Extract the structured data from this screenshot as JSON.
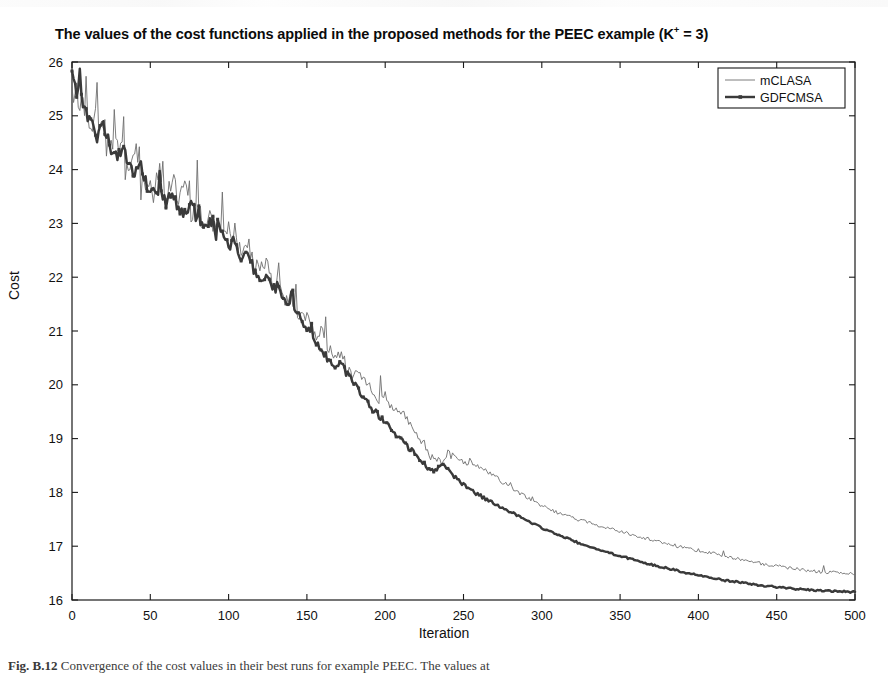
{
  "figure": {
    "title_prefix": "The values of the cost functions applied in the proposed methods for the PEEC example (K",
    "title_superscript": "+",
    "title_suffix": " = 3)",
    "caption_label": "Fig. B.12",
    "caption_text": "  Convergence of the cost values in their best runs for example PEEC. The values at"
  },
  "chart_data": {
    "type": "line",
    "title": "The values of the cost functions applied in the proposed methods for the PEEC example (K+ = 3)",
    "xlabel": "Iteration",
    "ylabel": "Cost",
    "xlim": [
      0,
      500
    ],
    "ylim": [
      16,
      26
    ],
    "xticks": [
      0,
      50,
      100,
      150,
      200,
      250,
      300,
      350,
      400,
      450,
      500
    ],
    "yticks": [
      16,
      17,
      18,
      19,
      20,
      21,
      22,
      23,
      24,
      25,
      26
    ],
    "grid": false,
    "legend_position": "top-right",
    "colors": {
      "mCLASA": "#6e6e6e",
      "GDFCMSA": "#3a3a3a",
      "axis": "#1a1a1a"
    },
    "series": [
      {
        "name": "mCLASA",
        "style": "thin-line",
        "x": [
          0,
          4,
          8,
          12,
          16,
          20,
          24,
          28,
          32,
          36,
          40,
          44,
          48,
          52,
          56,
          60,
          64,
          68,
          72,
          76,
          80,
          84,
          88,
          92,
          96,
          100,
          104,
          108,
          112,
          116,
          120,
          124,
          128,
          132,
          136,
          140,
          144,
          148,
          152,
          156,
          160,
          164,
          168,
          172,
          176,
          180,
          184,
          188,
          192,
          196,
          200,
          204,
          208,
          212,
          216,
          220,
          224,
          228,
          232,
          236,
          240,
          244,
          248,
          252,
          256,
          260,
          264,
          268,
          272,
          276,
          280,
          284,
          288,
          292,
          296,
          300,
          310,
          320,
          330,
          340,
          350,
          360,
          370,
          380,
          390,
          400,
          410,
          420,
          430,
          440,
          450,
          460,
          470,
          480,
          490,
          500
        ],
        "values": [
          25.55,
          25.35,
          25.05,
          24.72,
          24.95,
          24.6,
          24.32,
          24.55,
          24.18,
          23.9,
          24.25,
          23.62,
          23.85,
          23.48,
          24.05,
          23.35,
          23.95,
          23.3,
          23.72,
          23.18,
          23.4,
          22.95,
          23.25,
          22.8,
          23.1,
          22.62,
          22.85,
          22.4,
          22.7,
          22.25,
          22.1,
          22.35,
          21.8,
          21.95,
          21.55,
          21.7,
          21.25,
          21.4,
          21.05,
          20.85,
          21.0,
          20.65,
          20.45,
          20.58,
          20.3,
          20.15,
          20.25,
          20.05,
          19.9,
          19.7,
          19.82,
          19.55,
          19.4,
          19.48,
          19.25,
          19.1,
          18.95,
          18.7,
          18.62,
          18.55,
          18.72,
          18.65,
          18.58,
          18.5,
          18.55,
          18.45,
          18.4,
          18.32,
          18.25,
          18.18,
          18.1,
          18.02,
          17.95,
          17.88,
          17.8,
          17.75,
          17.62,
          17.52,
          17.44,
          17.36,
          17.28,
          17.2,
          17.12,
          17.05,
          16.98,
          16.92,
          16.86,
          16.8,
          16.74,
          16.68,
          16.63,
          16.59,
          16.55,
          16.52,
          16.5,
          16.48
        ]
      },
      {
        "name": "GDFCMSA",
        "style": "thick-line-with-markers",
        "x": [
          0,
          4,
          8,
          12,
          16,
          20,
          24,
          28,
          32,
          36,
          40,
          44,
          48,
          52,
          56,
          60,
          64,
          68,
          72,
          76,
          80,
          84,
          88,
          92,
          96,
          100,
          104,
          108,
          112,
          116,
          120,
          124,
          128,
          132,
          136,
          140,
          144,
          148,
          152,
          156,
          160,
          164,
          168,
          172,
          176,
          180,
          184,
          188,
          192,
          196,
          200,
          204,
          208,
          212,
          216,
          220,
          224,
          228,
          232,
          236,
          240,
          244,
          248,
          252,
          256,
          260,
          264,
          268,
          272,
          276,
          280,
          284,
          288,
          292,
          296,
          300,
          310,
          320,
          330,
          340,
          350,
          360,
          370,
          380,
          390,
          400,
          410,
          420,
          430,
          440,
          450,
          460,
          470,
          480,
          490,
          500
        ],
        "values": [
          25.7,
          25.42,
          25.15,
          24.85,
          24.62,
          24.78,
          24.45,
          24.28,
          24.4,
          24.1,
          23.88,
          24.05,
          23.7,
          23.52,
          23.65,
          23.38,
          23.55,
          23.3,
          23.18,
          23.42,
          23.05,
          22.9,
          23.1,
          22.78,
          22.95,
          22.55,
          22.7,
          22.3,
          22.45,
          22.15,
          21.95,
          22.08,
          21.75,
          21.85,
          21.5,
          21.6,
          21.3,
          21.15,
          20.95,
          20.78,
          20.6,
          20.45,
          20.3,
          20.38,
          20.18,
          20.05,
          19.88,
          19.7,
          19.55,
          19.42,
          19.3,
          19.18,
          19.05,
          18.92,
          18.8,
          18.68,
          18.55,
          18.42,
          18.4,
          18.5,
          18.45,
          18.3,
          18.2,
          18.1,
          18.02,
          17.95,
          17.88,
          17.82,
          17.76,
          17.7,
          17.64,
          17.58,
          17.52,
          17.46,
          17.4,
          17.34,
          17.22,
          17.1,
          16.99,
          16.9,
          16.82,
          16.74,
          16.66,
          16.59,
          16.52,
          16.46,
          16.4,
          16.35,
          16.31,
          16.27,
          16.24,
          16.21,
          16.19,
          16.17,
          16.16,
          16.15
        ]
      }
    ]
  },
  "legend": {
    "items": [
      {
        "label": "mCLASA"
      },
      {
        "label": "GDFCMSA"
      }
    ]
  }
}
